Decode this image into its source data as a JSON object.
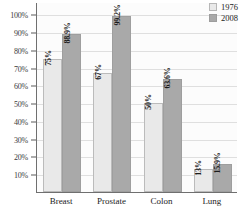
{
  "chart_data": {
    "type": "bar",
    "title": "",
    "xlabel": "",
    "ylabel": "",
    "categories": [
      "Breast",
      "Prostate",
      "Colon",
      "Lung"
    ],
    "series": [
      {
        "name": "1976",
        "color": "#e9e9e9",
        "values": [
          75,
          67,
          50,
          13
        ],
        "labels": [
          "75%",
          "67%",
          "50%",
          "13%"
        ]
      },
      {
        "name": "2008",
        "color": "#a9a9a9",
        "values": [
          88.9,
          99.2,
          63.6,
          15.9
        ],
        "labels": [
          "88.9%",
          "99.2%",
          "63.6%",
          "15.9%"
        ]
      }
    ],
    "ylim": [
      0,
      107
    ],
    "yticks": [
      10,
      20,
      30,
      40,
      50,
      60,
      70,
      80,
      90,
      100
    ],
    "yticklabels": [
      "10%",
      "20%",
      "30%",
      "40%",
      "50%",
      "60%",
      "70%",
      "80%",
      "90%",
      "100%"
    ],
    "grid": true,
    "legend_position": "top-right"
  },
  "legend": {
    "entries": [
      {
        "label": "1976",
        "swatch": "legend-swatch-1976"
      },
      {
        "label": "2008",
        "swatch": "legend-swatch-2008"
      }
    ]
  }
}
